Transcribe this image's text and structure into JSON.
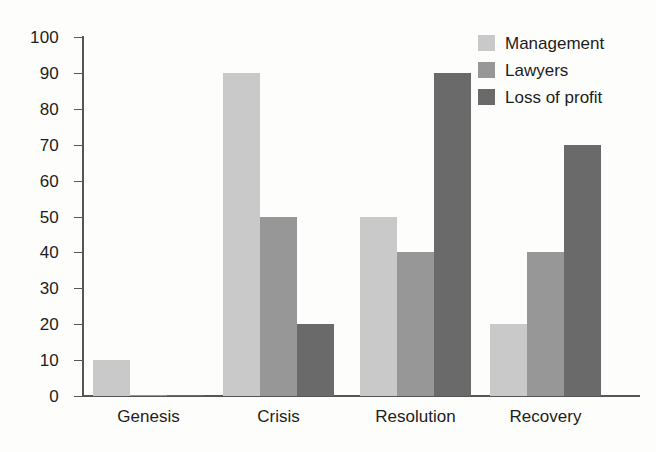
{
  "chart_data": {
    "type": "bar",
    "title": "",
    "subtitle": "",
    "xlabel": "",
    "ylabel": "",
    "categories": [
      "Genesis",
      "Crisis",
      "Resolution",
      "Recovery"
    ],
    "series": [
      {
        "name": "Management",
        "color": "#c9c9c9",
        "values": [
          10,
          90,
          50,
          20
        ]
      },
      {
        "name": "Lawyers",
        "color": "#979797",
        "values": [
          0,
          50,
          40,
          40
        ]
      },
      {
        "name": "Loss of profit",
        "color": "#6a6a6a",
        "values": [
          0,
          20,
          90,
          70
        ]
      }
    ],
    "ylim": [
      0,
      100
    ],
    "ytick_step": 10,
    "ytick_labels": [
      "0",
      "10",
      "20",
      "30",
      "40",
      "50",
      "60",
      "70",
      "80",
      "90",
      "100"
    ],
    "grid": false,
    "legend_position": "top-right",
    "annotations": []
  },
  "legend": {
    "items": [
      {
        "label": "Management"
      },
      {
        "label": "Lawyers"
      },
      {
        "label": "Loss of profit"
      }
    ]
  }
}
